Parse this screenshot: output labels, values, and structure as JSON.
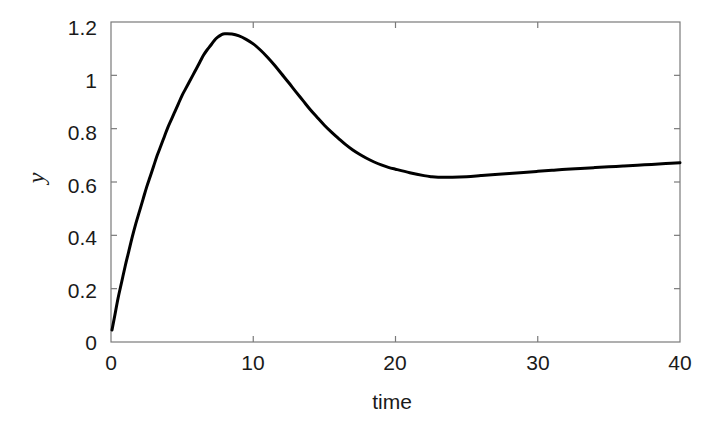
{
  "chart_data": {
    "type": "line",
    "title": "",
    "xlabel": "time",
    "ylabel": "y",
    "xlim": [
      0,
      40
    ],
    "ylim": [
      0,
      1.2
    ],
    "grid": false,
    "legend": null,
    "xticks": [
      0,
      10,
      20,
      30,
      40
    ],
    "xtick_labels": [
      "0",
      "10",
      "20",
      "30",
      "40"
    ],
    "yticks": [
      0,
      0.2,
      0.4,
      0.6,
      0.8,
      1.0,
      1.2
    ],
    "ytick_labels": [
      "0",
      "0.2",
      "0.4",
      "0.6",
      "0.8",
      "1",
      "1.2"
    ],
    "line_color": "#000000",
    "line_width": 3,
    "axis_color": "#7a7a7a",
    "background_color": "#ffffff",
    "annotations": {
      "peak": {
        "x": 7.0,
        "y": 1.155
      },
      "trough": {
        "x": 22.5,
        "y": 0.618
      },
      "start": {
        "x": 0.07,
        "y": 0.045
      },
      "end": {
        "x": 40,
        "y": 0.672
      }
    },
    "series": [
      {
        "name": "y(t)",
        "x": [
          0.07,
          0.25,
          0.5,
          0.75,
          1.0,
          1.25,
          1.5,
          1.75,
          2.0,
          2.25,
          2.5,
          2.75,
          3.0,
          3.25,
          3.5,
          3.75,
          4.0,
          4.25,
          4.5,
          4.75,
          5.0,
          5.25,
          5.5,
          5.75,
          6.0,
          6.25,
          6.5,
          6.75,
          7.0,
          7.25,
          7.5,
          7.75,
          8.0,
          8.5,
          9.0,
          9.5,
          10.0,
          10.5,
          11.0,
          11.5,
          12.0,
          12.5,
          13.0,
          13.5,
          14.0,
          14.5,
          15.0,
          15.5,
          16.0,
          16.5,
          17.0,
          17.5,
          18.0,
          18.5,
          19.0,
          19.5,
          20.0,
          21.0,
          22.0,
          22.5,
          23.0,
          24.0,
          25.0,
          26.0,
          27.0,
          28.0,
          29.0,
          30.0,
          31.0,
          32.0,
          33.0,
          34.0,
          35.0,
          36.0,
          37.0,
          38.0,
          39.0,
          40.0
        ],
        "y": [
          0.045,
          0.095,
          0.165,
          0.225,
          0.285,
          0.34,
          0.395,
          0.445,
          0.49,
          0.535,
          0.58,
          0.62,
          0.66,
          0.7,
          0.735,
          0.77,
          0.805,
          0.835,
          0.865,
          0.895,
          0.925,
          0.95,
          0.975,
          1.0,
          1.025,
          1.05,
          1.075,
          1.095,
          1.112,
          1.13,
          1.143,
          1.152,
          1.156,
          1.155,
          1.148,
          1.135,
          1.118,
          1.095,
          1.068,
          1.038,
          1.005,
          0.972,
          0.938,
          0.905,
          0.872,
          0.842,
          0.813,
          0.787,
          0.763,
          0.74,
          0.72,
          0.703,
          0.688,
          0.675,
          0.664,
          0.655,
          0.648,
          0.635,
          0.624,
          0.62,
          0.618,
          0.618,
          0.62,
          0.624,
          0.628,
          0.632,
          0.636,
          0.64,
          0.644,
          0.648,
          0.651,
          0.654,
          0.657,
          0.66,
          0.663,
          0.666,
          0.669,
          0.672
        ]
      }
    ]
  },
  "axes": {
    "x_label": "time",
    "y_label": "y",
    "x_tick_labels": [
      "0",
      "10",
      "20",
      "30",
      "40"
    ],
    "y_tick_labels": [
      "1.2",
      "1",
      "0.8",
      "0.6",
      "0.4",
      "0.2",
      "0"
    ]
  }
}
